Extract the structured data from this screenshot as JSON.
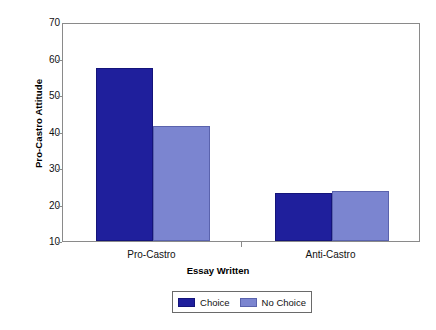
{
  "chart_data": {
    "type": "bar",
    "title": "",
    "subtitle": "",
    "xlabel": "Essay Written",
    "ylabel": "Pro-Castro Attitude",
    "categories": [
      "Pro-Castro",
      "Anti-Castro"
    ],
    "series": [
      {
        "name": "Choice",
        "color": "#1f1f9c",
        "values": [
          57.5,
          23.2
        ]
      },
      {
        "name": "No Choice",
        "color": "#7b85d0",
        "values": [
          41.5,
          23.8
        ]
      }
    ],
    "ylim": [
      10,
      70
    ],
    "yticks": [
      10,
      20,
      30,
      40,
      50,
      60,
      70
    ],
    "ytick_labels": [
      "10",
      "20",
      "30",
      "40",
      "50",
      "60",
      "70"
    ],
    "grid": false,
    "legend_position": "bottom-center",
    "legend_entries": [
      "Choice",
      "No Choice"
    ],
    "frame": true
  },
  "axes": {
    "y_title": "Pro-Castro Attitude",
    "x_title": "Essay Written"
  },
  "legend": {
    "items": [
      {
        "label": "Choice",
        "swatch": "dark-blue-swatch"
      },
      {
        "label": "No Choice",
        "swatch": "light-blue-swatch"
      }
    ]
  }
}
